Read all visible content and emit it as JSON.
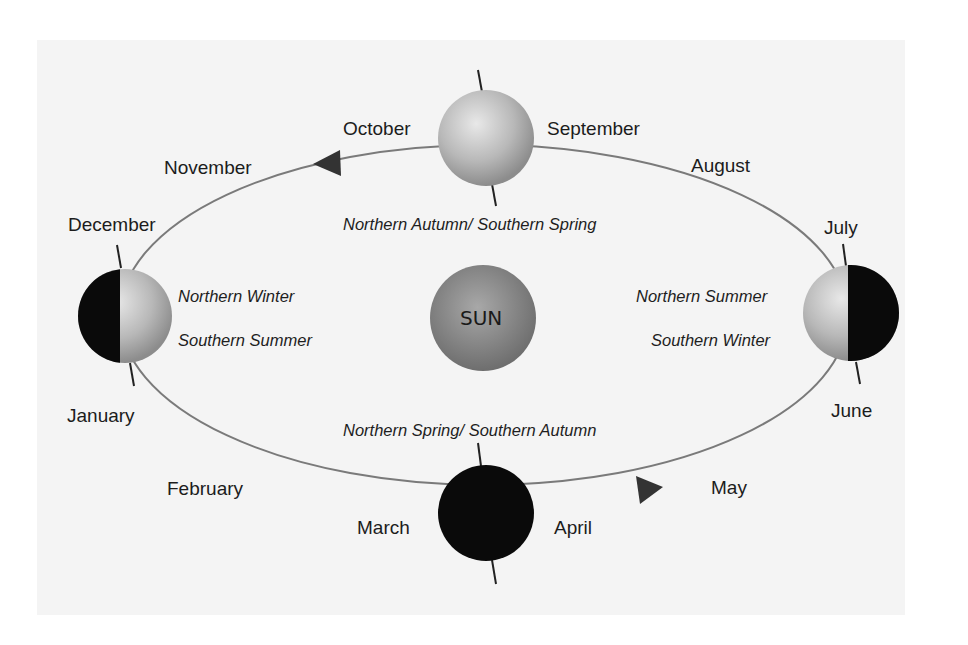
{
  "diagram": {
    "center_label": "SUN",
    "months": {
      "january": "January",
      "february": "February",
      "march": "March",
      "april": "April",
      "may": "May",
      "june": "June",
      "july": "July",
      "august": "August",
      "september": "September",
      "october": "October",
      "november": "November",
      "december": "December"
    },
    "seasons": {
      "top": "Northern Autumn/ Southern Spring",
      "bottom": "Northern Spring/ Southern Autumn",
      "left_1": "Northern Winter",
      "left_2": "Southern Summer",
      "right_1": "Northern Summer",
      "right_2": "Southern Winter"
    },
    "colors": {
      "background": "#f4f4f4",
      "orbit": "#7a7a7a",
      "night": "#0a0a0a",
      "globe_light": "#d8d8d8",
      "sun": "#8a8a8a"
    },
    "arrows": [
      "counterclockwise-top-left",
      "counterclockwise-bottom-right"
    ]
  }
}
